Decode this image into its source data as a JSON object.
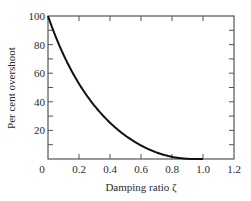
{
  "chart_data": {
    "type": "line",
    "title": "",
    "xlabel": "Damping ratio ζ",
    "ylabel": "Per cent overshoot",
    "xlim": [
      0,
      1.2
    ],
    "ylim": [
      0,
      100
    ],
    "x_ticks": [
      0,
      0.2,
      0.4,
      0.6,
      0.8,
      1.0,
      1.2
    ],
    "x_tick_labels": [
      "0",
      "0.2",
      "0.4",
      "0.6",
      "0.8",
      "1.0",
      "1.2"
    ],
    "y_ticks": [
      20,
      40,
      60,
      80,
      100
    ],
    "y_tick_labels": [
      "20",
      "40",
      "60",
      "80",
      "100"
    ],
    "y_minor_step": 10,
    "grid": false,
    "legend": null,
    "series": [
      {
        "name": "Per cent overshoot",
        "formula": "100*exp(-pi*zeta/sqrt(1-zeta^2))",
        "x": [
          0,
          0.1,
          0.2,
          0.3,
          0.4,
          0.5,
          0.6,
          0.7,
          0.8,
          0.9,
          1.0
        ],
        "y": [
          100,
          72.9,
          52.7,
          37.2,
          25.4,
          16.3,
          9.5,
          4.6,
          1.5,
          0.2,
          0
        ]
      }
    ],
    "line_color": "#111111",
    "axis_color": "#555555"
  }
}
